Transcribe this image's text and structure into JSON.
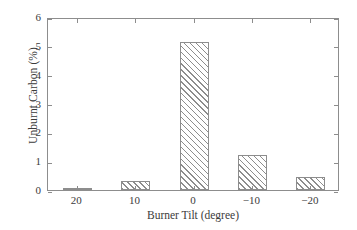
{
  "chart_data": {
    "type": "bar",
    "title": "",
    "xlabel": "Burner Tilt (degree)",
    "ylabel": "Unburnt Carbon (%)",
    "categories": [
      "20",
      "10",
      "0",
      "−10",
      "−20"
    ],
    "values": [
      0.06,
      0.33,
      5.15,
      1.22,
      0.44
    ],
    "ylim": [
      0,
      6
    ],
    "yticks": [
      0,
      1,
      2,
      3,
      4,
      5,
      6
    ],
    "ytick_labels": [
      "0",
      "1",
      "2",
      "3",
      "4",
      "5",
      "6"
    ],
    "grid": false,
    "legend": null,
    "bar_style": {
      "fill": "#ffffff",
      "hatch": "diagonal-forward",
      "edge_color": "#8d8d8d"
    },
    "frame_color": "#8d8d8d",
    "background": "#ffffff"
  }
}
